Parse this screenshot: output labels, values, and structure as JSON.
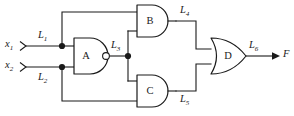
{
  "figure": {
    "name": "logic-circuit-diagram",
    "type": "combinational-logic-circuit",
    "background_color": "#ffffff",
    "line_color": "#1a1a1a"
  },
  "inputs": [
    {
      "id": "x1",
      "label": "x",
      "subscript": "1",
      "wire_label": "L",
      "wire_subscript": "1"
    },
    {
      "id": "x2",
      "label": "x",
      "subscript": "2",
      "wire_label": "L",
      "wire_subscript": "2"
    }
  ],
  "gates": [
    {
      "id": "A",
      "letter": "A",
      "type": "nand",
      "inverted_output": true,
      "inputs": [
        "L1",
        "L2"
      ],
      "output": "L3"
    },
    {
      "id": "B",
      "letter": "B",
      "type": "and",
      "inverted_output": false,
      "inputs": [
        "L1",
        "L3"
      ],
      "output": "L4"
    },
    {
      "id": "C",
      "letter": "C",
      "type": "and",
      "inverted_output": false,
      "inputs": [
        "L3",
        "L2"
      ],
      "output": "L5"
    },
    {
      "id": "D",
      "letter": "D",
      "type": "or",
      "inverted_output": false,
      "inputs": [
        "L4",
        "L5"
      ],
      "output": "L6"
    }
  ],
  "signal_labels": [
    {
      "id": "L1",
      "base": "L",
      "sub": "1"
    },
    {
      "id": "L2",
      "base": "L",
      "sub": "2"
    },
    {
      "id": "L3",
      "base": "L",
      "sub": "3"
    },
    {
      "id": "L4",
      "base": "L",
      "sub": "4"
    },
    {
      "id": "L5",
      "base": "L",
      "sub": "5"
    },
    {
      "id": "L6",
      "base": "L",
      "sub": "6"
    }
  ],
  "output": {
    "id": "F",
    "label": "F"
  },
  "labels": {
    "x1_base": "x",
    "x1_sub": "1",
    "x2_base": "x",
    "x2_sub": "2",
    "L1_base": "L",
    "L1_sub": "1",
    "L2_base": "L",
    "L2_sub": "2",
    "L3_base": "L",
    "L3_sub": "3",
    "L4_base": "L",
    "L4_sub": "4",
    "L5_base": "L",
    "L5_sub": "5",
    "L6_base": "L",
    "L6_sub": "6",
    "F": "F",
    "gate_a": "A",
    "gate_b": "B",
    "gate_c": "C",
    "gate_d": "D"
  }
}
